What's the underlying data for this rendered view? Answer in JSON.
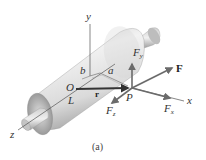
{
  "figure": {
    "caption": "(a)",
    "axes": {
      "x": "x",
      "y": "y",
      "z": "z"
    },
    "points": {
      "origin": "O",
      "point": "P",
      "length_label": "L"
    },
    "dimensions": {
      "a": "a",
      "b": "b"
    },
    "vectors": {
      "r": "r",
      "F": "F",
      "Fx": {
        "base": "F",
        "sub": "x"
      },
      "Fy": {
        "base": "F",
        "sub": "y"
      },
      "Fz": {
        "base": "F",
        "sub": "z"
      }
    },
    "colors": {
      "cylinder_light": "#eeeeee",
      "cylinder_dark": "#a8a8a8",
      "vector": "#6b6b6b",
      "r_vector": "#333333",
      "axis": "#555555"
    }
  }
}
